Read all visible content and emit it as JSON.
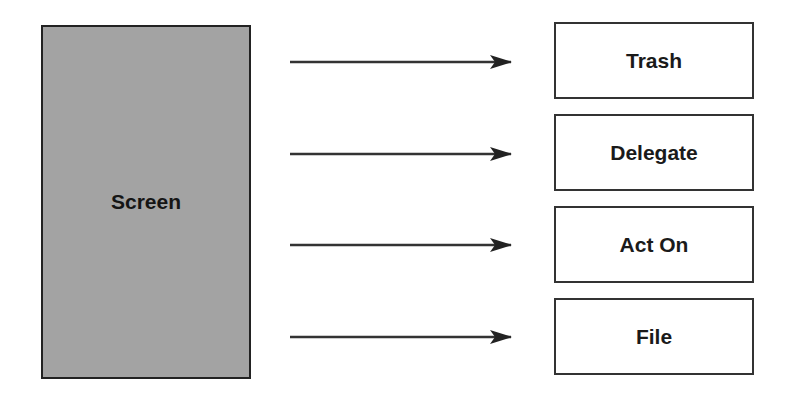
{
  "source": {
    "label": "Screen"
  },
  "targets": [
    {
      "label": "Trash",
      "top": 22
    },
    {
      "label": "Delegate",
      "top": 114
    },
    {
      "label": "Act On",
      "top": 206
    },
    {
      "label": "File",
      "top": 298
    }
  ],
  "arrows": [
    {
      "from": "Screen",
      "to": "Trash",
      "y": 62
    },
    {
      "from": "Screen",
      "to": "Delegate",
      "y": 154
    },
    {
      "from": "Screen",
      "to": "Act On",
      "y": 245
    },
    {
      "from": "Screen",
      "to": "File",
      "y": 337
    }
  ]
}
